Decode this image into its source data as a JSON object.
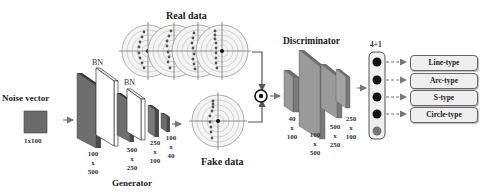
{
  "diagram": {
    "noise_vector": {
      "title": "Noise vector",
      "size": "1x100"
    },
    "generator": {
      "title": "Generator",
      "bn_label": "BN",
      "layers": [
        {
          "dim_top": "100",
          "dim_mid": "x",
          "dim_bot": "500"
        },
        {
          "dim_top": "500",
          "dim_mid": "x",
          "dim_bot": "250"
        },
        {
          "dim_top": "250",
          "dim_mid": "x",
          "dim_bot": "100"
        },
        {
          "dim_top": "100",
          "dim_mid": "x",
          "dim_bot": "40"
        }
      ]
    },
    "real_data": {
      "title": "Real data"
    },
    "fake_data": {
      "title": "Fake data"
    },
    "discriminator": {
      "title": "Discriminator",
      "layers": [
        {
          "dim_top": "40",
          "dim_mid": "x",
          "dim_bot": "100"
        },
        {
          "dim_top": "100",
          "dim_mid": "x",
          "dim_bot": "500"
        },
        {
          "dim_top": "500",
          "dim_mid": "x",
          "dim_bot": "250"
        },
        {
          "dim_top": "250",
          "dim_mid": "x",
          "dim_bot": "100"
        }
      ]
    },
    "output": {
      "title": "4+1",
      "classes": [
        "Line-type",
        "Arc-type",
        "S-type",
        "Circle-type"
      ]
    },
    "colors": {
      "layer_dark": "#5a5a5a",
      "layer_mid": "#8a8a8a",
      "layer_light": "#b0b0b0",
      "bn_fill": "#ffffff",
      "node_black": "#111111",
      "node_gray": "#777777",
      "arrow": "#777777"
    }
  }
}
